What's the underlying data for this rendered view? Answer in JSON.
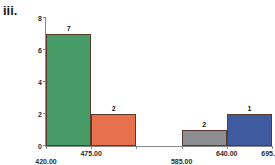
{
  "panel": {
    "label": "iii."
  },
  "chart_data": {
    "type": "bar",
    "title": "",
    "xlabel": "",
    "ylabel": "",
    "xlim": [
      420.0,
      695.0
    ],
    "ylim": [
      0,
      8
    ],
    "grid": false,
    "legend": "none",
    "bin_width": 55,
    "bin_edges": [
      420.0,
      475.0,
      530.0,
      585.0,
      640.0,
      695.0
    ],
    "bin_edge_labels": [
      "420.00",
      "475.00",
      "530.00",
      "585.00",
      "640.00",
      "695.00"
    ],
    "x_tick_labels_shown": [
      "420.00",
      "475.00",
      "585.00",
      "640.00",
      "695.00"
    ],
    "y_tick_values": [
      0,
      2,
      4,
      6,
      8
    ],
    "y_tick_labels": [
      "0",
      "2",
      "4",
      "6",
      "8"
    ],
    "categories": [
      "420.00-475.00",
      "475.00-530.00",
      "530.00-585.00",
      "585.00-640.00",
      "640.00-695.00"
    ],
    "values": [
      7,
      2,
      0,
      1,
      2
    ],
    "data_labels": [
      "7",
      "2",
      "",
      "2",
      "1"
    ],
    "colors": [
      "#469b67",
      "#e8714d",
      "",
      "#8c8f91",
      "#3f5a9e"
    ],
    "bar_edge_color": "#6b4a33",
    "bars": [
      {
        "label": "7",
        "value": 7,
        "x0": 420.0,
        "x1": 475.0,
        "color": "#469b67"
      },
      {
        "label": "2",
        "value": 2,
        "x0": 475.0,
        "x1": 530.0,
        "color": "#e8714d"
      },
      {
        "label": "",
        "value": 0,
        "x0": 530.0,
        "x1": 585.0,
        "color": ""
      },
      {
        "label": "2",
        "value": 1,
        "x0": 585.0,
        "x1": 640.0,
        "color": "#8c8f91"
      },
      {
        "label": "1",
        "value": 2,
        "x0": 640.0,
        "x1": 695.0,
        "color": "#3f5a9e"
      }
    ]
  }
}
